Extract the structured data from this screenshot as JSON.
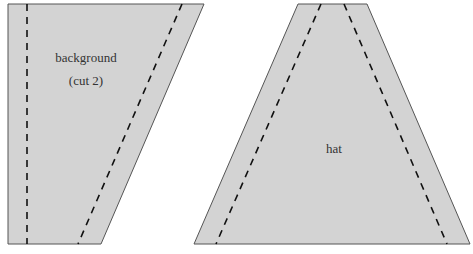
{
  "colors": {
    "piece_fill": "#d3d3d3",
    "piece_outline": "#555555",
    "seam_line": "#111111",
    "label_text": "#333333",
    "background": "#ffffff"
  },
  "pieces": [
    {
      "id": "background",
      "shape": "trapezoid-slanted-right",
      "label_line1": "background",
      "label_line2": "(cut 2)",
      "seam_allowance": "dashed"
    },
    {
      "id": "hat",
      "shape": "trapezoid-symmetric",
      "label_line1": "hat",
      "seam_allowance": "dashed"
    }
  ]
}
